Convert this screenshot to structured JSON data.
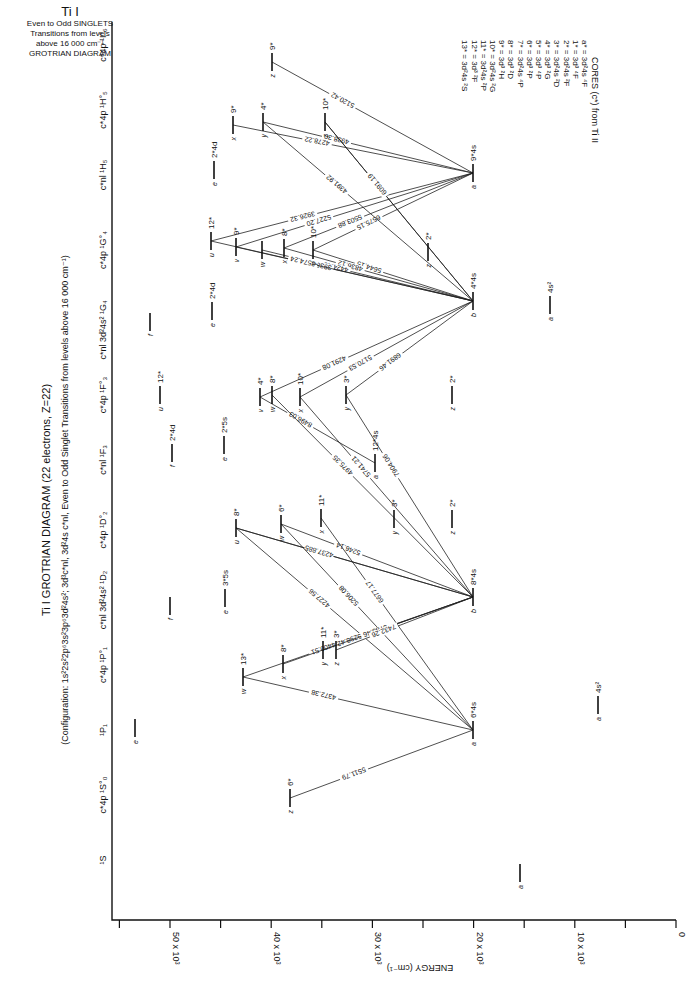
{
  "corner_title": {
    "element": "Ti I",
    "lines": [
      "Even to Odd SINGLETS",
      "Transitions from levels",
      "above 16 000 cm⁻¹",
      "GROTRIAN DIAGRAM"
    ]
  },
  "main_title": "Ti I GROTRIAN DIAGRAM (22 electrons, Z=22)",
  "subtitle": "(Configuration: 1s²2s²2p⁶3s²3p⁶3d²4s²; 3d³c*nl, 3d²4s c*nl, Even to Odd Singlet Transitions from levels above 16 000 cm⁻¹)",
  "axis": {
    "label": "ENERGY (cm⁻¹)",
    "ticks": [
      {
        "value": 0,
        "label": "0"
      },
      {
        "value": 10000,
        "label": "10 x 10³"
      },
      {
        "value": 20000,
        "label": "20 x 10³"
      },
      {
        "value": 30000,
        "label": "30 x 10³"
      },
      {
        "value": 40000,
        "label": "40 x 10³"
      },
      {
        "value": 50000,
        "label": "50 x 10³"
      }
    ]
  },
  "columns": [
    {
      "label": "¹S",
      "y": 860
    },
    {
      "label": "c*4p ¹S°₀",
      "y": 795
    },
    {
      "label": "¹P₁",
      "y": 730
    },
    {
      "label": "c*4p ¹P°₁",
      "y": 665
    },
    {
      "label": "c*nl 3d²4s² ¹D₂",
      "y": 600
    },
    {
      "label": "c*4p ¹D°₂",
      "y": 530
    },
    {
      "label": "c*nl ¹F₃",
      "y": 460
    },
    {
      "label": "c*4p ¹F°₃",
      "y": 395
    },
    {
      "label": "c*nl 3d²4s² ¹G₄",
      "y": 330
    },
    {
      "label": "c*4p ¹G°₄",
      "y": 250
    },
    {
      "label": "c*nl ¹H₅",
      "y": 175
    },
    {
      "label": "c*4p ¹H°₅",
      "y": 110
    },
    {
      "label": "c*4p ¹I°₆",
      "y": 45
    }
  ],
  "cores_legend": {
    "title": "CORES (c*) from Ti II",
    "items": [
      "a* = 3d²4s ⁴F",
      "1* = 3d³ ⁴F",
      "2* = 3d²4s ²F",
      "3* = 3d²4s ²D",
      "4* = 3d³ ²G",
      "5* = 3d³ ⁴P",
      "6* = 3d³ ²P",
      "7* = 3d²4s ⁴P",
      "8* = 3d³ ²D",
      "9* = 3d³ ²H",
      "10* = 3d²4s ²G",
      "11* = 3d²4s ²P",
      "12* = 3d³ ²F",
      "13* = 3d²4s ²S"
    ]
  },
  "levels": [
    {
      "id": "S-a",
      "x": 520,
      "y": 873,
      "label": "a",
      "core": ""
    },
    {
      "id": "S0-z",
      "x": 290,
      "y": 798,
      "label": "z",
      "core": "6*"
    },
    {
      "id": "P1-e",
      "x": 135,
      "y": 728,
      "label": "e",
      "core": ""
    },
    {
      "id": "P1-a",
      "x": 473,
      "y": 730,
      "label": "a",
      "core": "6*4s"
    },
    {
      "id": "P1o-w",
      "x": 243,
      "y": 677,
      "label": "w",
      "core": "13*"
    },
    {
      "id": "P1o-x",
      "x": 283,
      "y": 664,
      "label": "x",
      "core": "8*"
    },
    {
      "id": "P1o-y",
      "x": 323,
      "y": 650,
      "label": "y",
      "core": "11*"
    },
    {
      "id": "P1o-z",
      "x": 336,
      "y": 650,
      "label": "z",
      "core": "3*"
    },
    {
      "id": "D2-f",
      "x": 170,
      "y": 606,
      "label": "f",
      "core": ""
    },
    {
      "id": "D2-e",
      "x": 225,
      "y": 598,
      "label": "e",
      "core": "3*5s"
    },
    {
      "id": "D2-b",
      "x": 473,
      "y": 597,
      "label": "b",
      "core": "8*4s"
    },
    {
      "id": "D2-a",
      "x": 598,
      "y": 705,
      "label": "a",
      "core": "4s²"
    },
    {
      "id": "D2o-u",
      "x": 236,
      "y": 528,
      "label": "u",
      "core": "8*"
    },
    {
      "id": "D2o-w",
      "x": 281,
      "y": 524,
      "label": "w",
      "core": "6*"
    },
    {
      "id": "D2o-x",
      "x": 321,
      "y": 518,
      "label": "x",
      "core": "11*"
    },
    {
      "id": "D2o-y",
      "x": 394,
      "y": 519,
      "label": "y",
      "core": "3*"
    },
    {
      "id": "D2o-z",
      "x": 452,
      "y": 519,
      "label": "z",
      "core": "2*"
    },
    {
      "id": "F3-f",
      "x": 172,
      "y": 453,
      "label": "f",
      "core": "2*4d"
    },
    {
      "id": "F3-e",
      "x": 224,
      "y": 445,
      "label": "e",
      "core": "2*5s"
    },
    {
      "id": "F3-a",
      "x": 375,
      "y": 463,
      "label": "a",
      "core": "12*4s"
    },
    {
      "id": "F3o-u",
      "x": 160,
      "y": 395,
      "label": "u",
      "core": "12*"
    },
    {
      "id": "F3o-v",
      "x": 260,
      "y": 397,
      "label": "v",
      "core": "4*"
    },
    {
      "id": "F3o-w",
      "x": 272,
      "y": 395,
      "label": "w",
      "core": "8*"
    },
    {
      "id": "F3o-x",
      "x": 300,
      "y": 397,
      "label": "x",
      "core": "10*"
    },
    {
      "id": "F3o-y",
      "x": 346,
      "y": 395,
      "label": "y",
      "core": "3*"
    },
    {
      "id": "F3o-z",
      "x": 452,
      "y": 395,
      "label": "z",
      "core": "2*"
    },
    {
      "id": "G4-f",
      "x": 150,
      "y": 322,
      "label": "f",
      "core": ""
    },
    {
      "id": "G4-e",
      "x": 212,
      "y": 311,
      "label": "e",
      "core": "2*4d"
    },
    {
      "id": "G4-b",
      "x": 473,
      "y": 301,
      "label": "b",
      "core": "4*4s"
    },
    {
      "id": "G4-a",
      "x": 550,
      "y": 305,
      "label": "a",
      "core": "4s²"
    },
    {
      "id": "G4o-u",
      "x": 211,
      "y": 241,
      "label": "u",
      "core": "12*"
    },
    {
      "id": "G4o-v",
      "x": 236,
      "y": 247,
      "label": "v",
      "core": "9*"
    },
    {
      "id": "G4o-w",
      "x": 262,
      "y": 250,
      "label": "w",
      "core": ""
    },
    {
      "id": "G4o-x",
      "x": 284,
      "y": 248,
      "label": "x",
      "core": "8*"
    },
    {
      "id": "G4o-y",
      "x": 313,
      "y": 250,
      "label": "y",
      "core": "10*"
    },
    {
      "id": "G4o-z",
      "x": 428,
      "y": 252,
      "label": "z",
      "core": "2*"
    },
    {
      "id": "H5-e",
      "x": 214,
      "y": 170,
      "label": "e",
      "core": "2*4d"
    },
    {
      "id": "H5-a",
      "x": 473,
      "y": 173,
      "label": "a",
      "core": "9*4s"
    },
    {
      "id": "H5o-x",
      "x": 233,
      "y": 125,
      "label": "x",
      "core": "9*"
    },
    {
      "id": "H5o-y",
      "x": 263,
      "y": 122,
      "label": "y",
      "core": "4*"
    },
    {
      "id": "H5o-z",
      "x": 325,
      "y": 122,
      "label": "z",
      "core": "10*"
    },
    {
      "id": "I6o-z",
      "x": 272,
      "y": 62,
      "label": "z",
      "core": "9*"
    }
  ],
  "transitions": [
    {
      "from": "I6o-z",
      "to": "H5-a",
      "label": "5120.42"
    },
    {
      "from": "H5o-y",
      "to": "H5-a",
      "label": "4938.30"
    },
    {
      "from": "H5o-x",
      "to": "H5-a",
      "label": "4278.22"
    },
    {
      "from": "H5o-z",
      "to": "G4-b",
      "label": ""
    },
    {
      "from": "G4o-u",
      "to": "H5-a",
      "label": "3926.32"
    },
    {
      "from": "G4o-v",
      "to": "H5-a",
      "label": "5227.20"
    },
    {
      "from": "G4o-x",
      "to": "H5-a",
      "label": "5503.88"
    },
    {
      "from": "G4o-y",
      "to": "H5-a",
      "label": "6575.15"
    },
    {
      "from": "H5o-y",
      "to": "G4-b",
      "label": "4391.92"
    },
    {
      "from": "H5o-z",
      "to": "G4-b",
      "label": "6091.19"
    },
    {
      "from": "G4o-y",
      "to": "G4-b",
      "label": "5644.15"
    },
    {
      "from": "G4o-x",
      "to": "G4-b",
      "label": "4836.12"
    },
    {
      "from": "G4o-w",
      "to": "G4-b",
      "label": "4424.40"
    },
    {
      "from": "G4o-v",
      "to": "G4-b",
      "label": "3938.00"
    },
    {
      "from": "G4o-u",
      "to": "G4-b",
      "label": "3574.24"
    },
    {
      "from": "F3o-v",
      "to": "G4-b",
      "label": "4291.08"
    },
    {
      "from": "F3o-x",
      "to": "G4-b",
      "label": "5170.53"
    },
    {
      "from": "F3o-y",
      "to": "G4-b",
      "label": "6891.46"
    },
    {
      "from": "F3o-v",
      "to": "F3-a",
      "label": "8496.03"
    },
    {
      "from": "F3o-w",
      "to": "D2-b",
      "label": "4975.35"
    },
    {
      "from": "F3o-x",
      "to": "D2-b",
      "label": "5741.21"
    },
    {
      "from": "F3o-y",
      "to": "D2-b",
      "label": "7904.06"
    },
    {
      "from": "D2o-w",
      "to": "D2-b",
      "label": "5246.14"
    },
    {
      "from": "D2o-u",
      "to": "D2-b",
      "label": "5227.20"
    },
    {
      "from": "D2o-u",
      "to": "D2-b",
      "label": "4237.885"
    },
    {
      "from": "D2o-u",
      "to": "P1-a",
      "label": "4227.56"
    },
    {
      "from": "D2o-w",
      "to": "P1-a",
      "label": "5206.08"
    },
    {
      "from": "D2o-x",
      "to": "P1-a",
      "label": "6677.17"
    },
    {
      "from": "P1o-w",
      "to": "D2-b",
      "label": "4400.51"
    },
    {
      "from": "P1o-x",
      "to": "D2-b",
      "label": "5298.42"
    },
    {
      "from": "P1o-y",
      "to": "D2-b",
      "label": "6783.46"
    },
    {
      "from": "P1o-z",
      "to": "D2-b",
      "label": "7432.26"
    },
    {
      "from": "P1o-w",
      "to": "P1-a",
      "label": "4372.38"
    },
    {
      "from": "S0-z",
      "to": "P1-a",
      "label": "5511.79"
    }
  ]
}
